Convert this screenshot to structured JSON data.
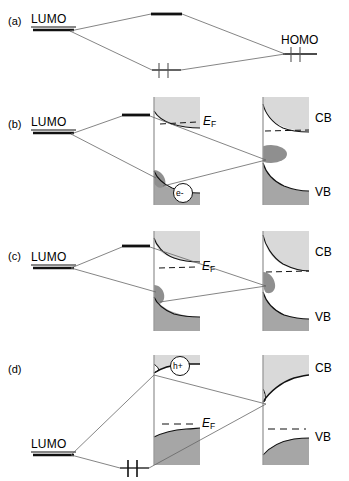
{
  "figure": {
    "title_hidden": "",
    "type": "energy-level-band-diagram",
    "colors": {
      "conduction_band_fill": "#d9d9d9",
      "valence_band_fill": "#a6a6a6",
      "surface_state_fill": "#9a9a9a",
      "line": "#1a1a1a",
      "thin_line": "#555555",
      "level_dark": "#111111"
    },
    "panels": [
      {
        "id": "a",
        "letter": "(a)",
        "molecule_left_label": "LUMO",
        "molecule_right_label": "HOMO",
        "has_semiconductors": false,
        "fermi_label": null,
        "carrier": null,
        "levels": [
          {
            "name": "LUMO",
            "role": "molecular-orbital-left",
            "occupied": false
          },
          {
            "name": "antibonding",
            "role": "dimer-upper",
            "occupied": false
          },
          {
            "name": "bonding",
            "role": "dimer-lower",
            "occupied": true,
            "electrons": 2
          },
          {
            "name": "HOMO",
            "role": "molecular-orbital-right",
            "occupied": true,
            "electrons": 2
          }
        ]
      },
      {
        "id": "b",
        "letter": "(b)",
        "molecule_left_label": "LUMO",
        "molecule_right_label": null,
        "has_semiconductors": true,
        "fermi_label": "E",
        "fermi_sub": "F",
        "carrier": "e-",
        "carrier_kind": "electron",
        "cb_label": "CB",
        "vb_label": "VB",
        "band_bending_left": "upward",
        "band_bending_right": "upward",
        "levels": [
          {
            "name": "LUMO",
            "role": "molecular-orbital-left",
            "occupied": false
          },
          {
            "name": "antibonding",
            "role": "dimer-upper",
            "occupied": false
          }
        ]
      },
      {
        "id": "c",
        "letter": "(c)",
        "molecule_left_label": "LUMO",
        "molecule_right_label": null,
        "has_semiconductors": true,
        "fermi_label": "E",
        "fermi_sub": "F",
        "carrier": null,
        "cb_label": "CB",
        "vb_label": "VB",
        "band_bending_left": "upward",
        "band_bending_right": "upward",
        "levels": [
          {
            "name": "LUMO",
            "role": "molecular-orbital-left",
            "occupied": false
          },
          {
            "name": "antibonding",
            "role": "dimer-upper",
            "occupied": false
          }
        ]
      },
      {
        "id": "d",
        "letter": "(d)",
        "molecule_left_label": "LUMO",
        "molecule_right_label": null,
        "has_semiconductors": true,
        "fermi_label": "E",
        "fermi_sub": "F",
        "carrier": "h+",
        "carrier_kind": "hole",
        "cb_label": "CB",
        "vb_label": "VB",
        "band_bending_left": "downward",
        "band_bending_right": "downward",
        "levels": [
          {
            "name": "LUMO",
            "role": "molecular-orbital-left",
            "occupied": false
          },
          {
            "name": "bonding",
            "role": "dimer-lower",
            "occupied": true,
            "electrons": 2
          }
        ]
      }
    ]
  },
  "labels": {
    "a_letter": "(a)",
    "a_lumo": "LUMO",
    "a_homo": "HOMO",
    "b_letter": "(b)",
    "b_lumo": "LUMO",
    "b_ef": "E",
    "b_ef_sub": "F",
    "b_cb": "CB",
    "b_vb": "VB",
    "b_carrier": "e-",
    "c_letter": "(c)",
    "c_lumo": "LUMO",
    "c_ef": "E",
    "c_ef_sub": "F",
    "c_cb": "CB",
    "c_vb": "VB",
    "d_letter": "(d)",
    "d_lumo": "LUMO",
    "d_ef": "E",
    "d_ef_sub": "F",
    "d_cb": "CB",
    "d_vb": "VB",
    "d_carrier": "h+"
  }
}
